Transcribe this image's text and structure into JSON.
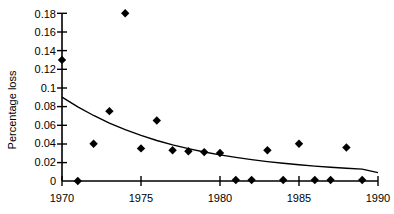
{
  "chart_data": {
    "type": "scatter",
    "title": "",
    "xlabel": "",
    "ylabel": "Percentage loss",
    "xlim": [
      1970,
      1990
    ],
    "ylim": [
      0,
      0.18
    ],
    "grid": false,
    "legend": "none",
    "x_ticks": [
      "1970",
      "1975",
      "1980",
      "1985",
      "1990"
    ],
    "x_tick_values": [
      1970,
      1975,
      1980,
      1985,
      1990
    ],
    "y_ticks": [
      "0",
      "0.02",
      "0.04",
      "0.06",
      "0.08",
      "0.1",
      "0.12",
      "0.14",
      "0.16",
      "0.18"
    ],
    "y_tick_values": [
      0,
      0.02,
      0.04,
      0.06,
      0.08,
      0.1,
      0.12,
      0.14,
      0.16,
      0.18
    ],
    "x": [
      1970,
      1971,
      1972,
      1973,
      1974,
      1975,
      1976,
      1977,
      1978,
      1979,
      1980,
      1981,
      1982,
      1983,
      1984,
      1985,
      1986,
      1987,
      1988,
      1989
    ],
    "values": [
      0.13,
      0.0,
      0.04,
      0.075,
      0.18,
      0.035,
      0.065,
      0.033,
      0.032,
      0.031,
      0.03,
      0.001,
      0.001,
      0.033,
      0.001,
      0.04,
      0.001,
      0.001,
      0.036,
      0.001
    ],
    "series": [
      {
        "name": "Percentage loss",
        "marker": "diamond",
        "color": "#000000",
        "x": [
          1970,
          1971,
          1972,
          1973,
          1974,
          1975,
          1976,
          1977,
          1978,
          1979,
          1980,
          1981,
          1982,
          1983,
          1984,
          1985,
          1986,
          1987,
          1988,
          1989
        ],
        "values": [
          0.13,
          0.0,
          0.04,
          0.075,
          0.18,
          0.035,
          0.065,
          0.033,
          0.032,
          0.031,
          0.03,
          0.001,
          0.001,
          0.033,
          0.001,
          0.04,
          0.001,
          0.001,
          0.036,
          0.001
        ]
      },
      {
        "name": "fitted trend",
        "type": "line",
        "color": "#000000",
        "x": [
          1970,
          1971,
          1972,
          1973,
          1974,
          1975,
          1976,
          1977,
          1978,
          1979,
          1980,
          1981,
          1982,
          1983,
          1984,
          1985,
          1986,
          1987,
          1988,
          1989,
          1990
        ],
        "values": [
          0.09,
          0.0795,
          0.0703,
          0.0622,
          0.0551,
          0.0489,
          0.0435,
          0.0388,
          0.0347,
          0.0311,
          0.028,
          0.0253,
          0.0229,
          0.0208,
          0.019,
          0.0174,
          0.016,
          0.0148,
          0.0137,
          0.0127,
          0.009
        ]
      }
    ]
  },
  "axis": {
    "y_title": "Percentage loss"
  }
}
